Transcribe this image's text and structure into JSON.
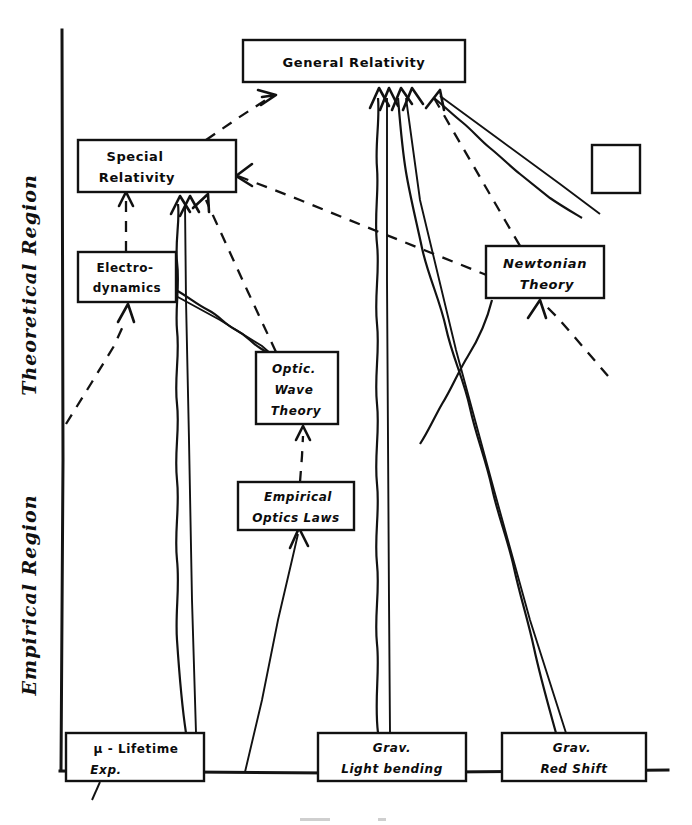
{
  "figure": {
    "axis": {
      "upper_region_label": "Theoretical Region",
      "lower_region_label": "Empirical Region"
    },
    "legend": {
      "dashed_meaning": "theoretical derivation",
      "wavy_meaning": "empirical support",
      "solid_meaning": "direct inference"
    },
    "colors": {
      "ink": "#111111",
      "paper": "#ffffff"
    },
    "nodes": [
      {
        "id": "general-relativity",
        "lines": [
          "General Relativity"
        ],
        "region": "theoretical",
        "x": 243,
        "y": 40,
        "w": 222,
        "h": 42
      },
      {
        "id": "special-relativity",
        "lines": [
          "Special",
          "Relativity"
        ],
        "region": "theoretical",
        "x": 78,
        "y": 140,
        "w": 158,
        "h": 52
      },
      {
        "id": "electrodynamics",
        "lines": [
          "Electro-",
          "dynamics"
        ],
        "region": "theoretical",
        "x": 78,
        "y": 252,
        "w": 98,
        "h": 50
      },
      {
        "id": "optic-wave-theory",
        "lines": [
          "Optic.",
          "Wave",
          "Theory"
        ],
        "region": "theoretical",
        "x": 256,
        "y": 352,
        "w": 82,
        "h": 72
      },
      {
        "id": "newtonian-theory",
        "lines": [
          "Newtonian",
          "Theory"
        ],
        "region": "theoretical",
        "x": 486,
        "y": 246,
        "w": 118,
        "h": 52
      },
      {
        "id": "unlabeled-box",
        "lines": [
          ""
        ],
        "region": "theoretical",
        "x": 592,
        "y": 145,
        "w": 48,
        "h": 48
      },
      {
        "id": "empirical-optics-laws",
        "lines": [
          "Empirical",
          "Optics Laws"
        ],
        "region": "empirical",
        "x": 238,
        "y": 482,
        "w": 116,
        "h": 48
      },
      {
        "id": "mu-lifetime-exp",
        "lines": [
          "μ - Lifetime",
          "Exp."
        ],
        "region": "empirical",
        "x": 66,
        "y": 733,
        "w": 138,
        "h": 48
      },
      {
        "id": "grav-light-bending",
        "lines": [
          "Grav.",
          "Light bending"
        ],
        "region": "empirical",
        "x": 318,
        "y": 733,
        "w": 148,
        "h": 48
      },
      {
        "id": "grav-red-shift",
        "lines": [
          "Grav.",
          "Red Shift"
        ],
        "region": "empirical",
        "x": 502,
        "y": 733,
        "w": 144,
        "h": 48
      }
    ],
    "edges": [
      {
        "id": "sr-to-gr",
        "from": "special-relativity",
        "to": "general-relativity",
        "style": "dashed"
      },
      {
        "id": "ed-to-sr",
        "from": "electrodynamics",
        "to": "special-relativity",
        "style": "dashed"
      },
      {
        "id": "owt-to-sr",
        "from": "optic-wave-theory",
        "to": "special-relativity",
        "style": "dashed"
      },
      {
        "id": "eol-to-owt",
        "from": "empirical-optics-laws",
        "to": "optic-wave-theory",
        "style": "dashed"
      },
      {
        "id": "ed-to-owt",
        "from": "electrodynamics",
        "to": "optic-wave-theory",
        "style": "wavy"
      },
      {
        "id": "mu-to-sr",
        "from": "mu-lifetime-exp",
        "to": "special-relativity",
        "style": "wavy"
      },
      {
        "id": "lightbending-to-gr",
        "from": "grav-light-bending",
        "to": "general-relativity",
        "style": "wavy"
      },
      {
        "id": "redshift-to-gr",
        "from": "grav-red-shift",
        "to": "general-relativity",
        "style": "wavy"
      },
      {
        "id": "nt-to-gr",
        "from": "newtonian-theory",
        "to": "general-relativity",
        "style": "wavy"
      },
      {
        "id": "gr-to-unlabeled",
        "from": "general-relativity",
        "to": "unlabeled-box",
        "style": "wavy"
      },
      {
        "id": "gr-to-nt",
        "from": "general-relativity",
        "to": "newtonian-theory",
        "style": "dashed"
      },
      {
        "id": "gr-down-left",
        "from": "general-relativity",
        "to": "lower-left",
        "style": "dashed"
      },
      {
        "id": "sr-right-in",
        "from": "right-field",
        "to": "special-relativity",
        "style": "dashed"
      },
      {
        "id": "eol-up-solid",
        "from": "baseline",
        "to": "empirical-optics-laws",
        "style": "solid"
      }
    ]
  }
}
